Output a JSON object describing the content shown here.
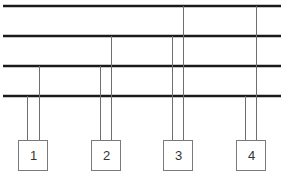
{
  "diagram": {
    "type": "multi-bus connection diagram",
    "buses": [
      {
        "id": "bus-1",
        "y": 6
      },
      {
        "id": "bus-2",
        "y": 36
      },
      {
        "id": "bus-3",
        "y": 66
      },
      {
        "id": "bus-4",
        "y": 96
      }
    ],
    "nodes": [
      {
        "label": "1",
        "x": 18,
        "connections": [
          {
            "x": 27,
            "bus_y": 96
          },
          {
            "x": 39,
            "bus_y": 66
          }
        ]
      },
      {
        "label": "2",
        "x": 91,
        "connections": [
          {
            "x": 100,
            "bus_y": 66
          },
          {
            "x": 111,
            "bus_y": 36
          }
        ]
      },
      {
        "label": "3",
        "x": 163,
        "connections": [
          {
            "x": 172,
            "bus_y": 36
          },
          {
            "x": 183,
            "bus_y": 6
          }
        ]
      },
      {
        "label": "4",
        "x": 236,
        "connections": [
          {
            "x": 245,
            "bus_y": 96
          },
          {
            "x": 256,
            "bus_y": 6
          }
        ]
      }
    ],
    "colors": {
      "bus": "#1a1a1a",
      "wire": "#6e6e6e",
      "box_border": "#7a7a7a"
    }
  }
}
